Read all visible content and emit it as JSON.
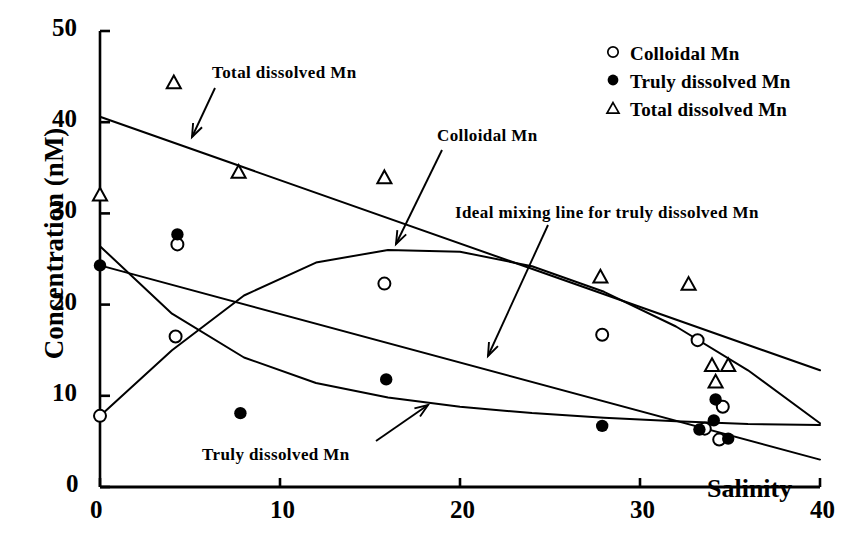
{
  "chart_data": {
    "type": "scatter",
    "title": "",
    "xlabel": "Salinity",
    "ylabel": "Concentration (nM)",
    "xlim": [
      0,
      40
    ],
    "ylim": [
      0,
      50
    ],
    "xticks": [
      "0",
      "10",
      "20",
      "30",
      "40"
    ],
    "yticks": [
      "0",
      "10",
      "20",
      "30",
      "40",
      "50"
    ],
    "grid": false,
    "legend_position": "top-right",
    "series": [
      {
        "name": "Colloidal Mn",
        "marker": "open-circle",
        "points": [
          {
            "x": 0.0,
            "y": 7.8
          },
          {
            "x": 4.2,
            "y": 16.5
          },
          {
            "x": 4.3,
            "y": 26.6
          },
          {
            "x": 15.8,
            "y": 22.3
          },
          {
            "x": 27.9,
            "y": 16.7
          },
          {
            "x": 33.2,
            "y": 16.1
          },
          {
            "x": 34.6,
            "y": 8.8
          },
          {
            "x": 33.6,
            "y": 6.4
          },
          {
            "x": 34.4,
            "y": 5.2
          }
        ]
      },
      {
        "name": "Truly dissolved Mn",
        "marker": "filled-circle",
        "points": [
          {
            "x": 0.0,
            "y": 24.3
          },
          {
            "x": 4.3,
            "y": 27.7
          },
          {
            "x": 7.8,
            "y": 8.1
          },
          {
            "x": 15.9,
            "y": 11.8
          },
          {
            "x": 27.9,
            "y": 6.7
          },
          {
            "x": 33.3,
            "y": 6.3
          },
          {
            "x": 34.2,
            "y": 9.6
          },
          {
            "x": 34.1,
            "y": 7.3
          },
          {
            "x": 34.9,
            "y": 5.3
          }
        ]
      },
      {
        "name": "Total dissolved Mn",
        "marker": "open-triangle",
        "points": [
          {
            "x": 0.0,
            "y": 32.0
          },
          {
            "x": 4.1,
            "y": 44.3
          },
          {
            "x": 7.7,
            "y": 34.5
          },
          {
            "x": 15.8,
            "y": 33.9
          },
          {
            "x": 27.8,
            "y": 23.0
          },
          {
            "x": 32.7,
            "y": 22.2
          },
          {
            "x": 34.0,
            "y": 13.3
          },
          {
            "x": 34.9,
            "y": 13.3
          },
          {
            "x": 34.2,
            "y": 11.5
          }
        ]
      }
    ],
    "fit_curves": [
      {
        "name": "Total dissolved Mn trend",
        "style": "solid",
        "points": [
          [
            0,
            40.6
          ],
          [
            40,
            12.8
          ]
        ]
      },
      {
        "name": "Ideal mixing line for truly dissolved Mn",
        "style": "solid",
        "points": [
          [
            0,
            24.3
          ],
          [
            40,
            3.0
          ]
        ]
      },
      {
        "name": "Colloidal Mn trend",
        "style": "solid",
        "points": [
          [
            0,
            7.8
          ],
          [
            4,
            15.0
          ],
          [
            8,
            21.0
          ],
          [
            12,
            24.6
          ],
          [
            16,
            26.0
          ],
          [
            20,
            25.8
          ],
          [
            24,
            24.2
          ],
          [
            28,
            21.4
          ],
          [
            32,
            17.6
          ],
          [
            36,
            12.8
          ],
          [
            40,
            7.0
          ]
        ]
      },
      {
        "name": "Truly dissolved Mn trend",
        "style": "solid",
        "points": [
          [
            0,
            26.4
          ],
          [
            4,
            19.0
          ],
          [
            8,
            14.2
          ],
          [
            12,
            11.4
          ],
          [
            16,
            9.8
          ],
          [
            20,
            8.8
          ],
          [
            24,
            8.1
          ],
          [
            28,
            7.6
          ],
          [
            32,
            7.2
          ],
          [
            36,
            6.9
          ],
          [
            40,
            6.8
          ]
        ]
      }
    ],
    "annotations": [
      {
        "text": "Total dissolved Mn",
        "label_x": 212,
        "label_y": 63,
        "arrow": {
          "x1": 215,
          "y1": 88,
          "x2": 192,
          "y2": 137
        }
      },
      {
        "text": "Colloidal Mn",
        "label_x": 437,
        "label_y": 126,
        "arrow": {
          "x1": 442,
          "y1": 150,
          "x2": 396,
          "y2": 244
        }
      },
      {
        "text": "Ideal mixing line for truly dissolved Mn",
        "label_x": 455,
        "label_y": 203,
        "arrow": {
          "x1": 548,
          "y1": 225,
          "x2": 488,
          "y2": 356
        }
      },
      {
        "text": "Truly dissolved Mn",
        "label_x": 202,
        "label_y": 445,
        "arrow": {
          "x1": 376,
          "y1": 441,
          "x2": 428,
          "y2": 405
        }
      }
    ]
  },
  "legend": {
    "items": [
      {
        "label": "Colloidal Mn",
        "marker": "open-circle"
      },
      {
        "label": "Truly dissolved Mn",
        "marker": "filled-circle"
      },
      {
        "label": "Total dissolved Mn",
        "marker": "open-triangle"
      }
    ]
  },
  "axes": {
    "x_title": "Salinity",
    "y_title": "Concentration (nM)"
  }
}
